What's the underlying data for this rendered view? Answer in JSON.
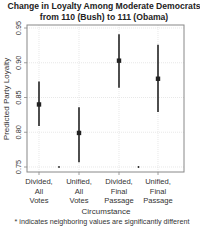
{
  "chart_data": {
    "type": "scatter",
    "subtype": "point-with-error-bars",
    "title": [
      "Change in Loyalty Among Moderate Democrats",
      "from 110 (Bush) to 111 (Obama)"
    ],
    "xlabel": "Circumstance",
    "ylabel": "Predicted Party Loyalty",
    "ylim": [
      0.75,
      0.95
    ],
    "yticks": [
      0.75,
      0.8,
      0.85,
      0.9,
      0.95
    ],
    "ytick_labels": [
      "0.75",
      "0.80",
      "0.85",
      "0.90",
      "0.95"
    ],
    "grid": true,
    "legend": null,
    "categories": [
      [
        "Divided,",
        "All",
        "Votes"
      ],
      [
        "Unified,",
        "All",
        "Votes"
      ],
      [
        "Divided,",
        "Final",
        "Passage"
      ],
      [
        "Unified,",
        "Final",
        "Passage"
      ]
    ],
    "points": [
      {
        "category": "Divided, All Votes",
        "estimate": 0.84,
        "lower": 0.809,
        "upper": 0.873
      },
      {
        "category": "Unified, All Votes",
        "estimate": 0.799,
        "lower": 0.757,
        "upper": 0.836
      },
      {
        "category": "Divided, Final Passage",
        "estimate": 0.903,
        "lower": 0.864,
        "upper": 0.941
      },
      {
        "category": "Unified, Final Passage",
        "estimate": 0.877,
        "lower": 0.829,
        "upper": 0.926
      }
    ],
    "significance_markers": [
      {
        "between": [
          0,
          1
        ],
        "symbol": "*"
      },
      {
        "between": [
          2,
          3
        ],
        "symbol": "*"
      }
    ],
    "footnote": "* indicates neighboring values are significantly different"
  },
  "colors": {
    "points": "#222222",
    "axis": "#888888",
    "grid": "#d8d8d8",
    "text": "#333333"
  }
}
